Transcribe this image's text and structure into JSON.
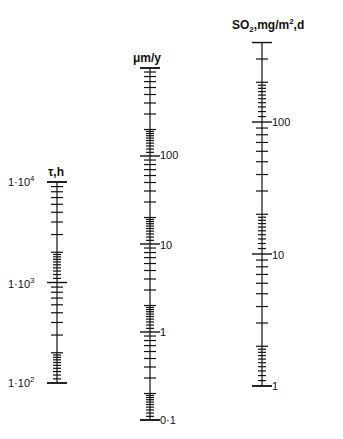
{
  "chart_data": {
    "type": "nomogram",
    "title": "",
    "axes": [
      {
        "id": "tau",
        "title": "τ, h",
        "scale": "log",
        "range": [
          100,
          10000
        ],
        "tick_labels": [
          "1·10²",
          "1·10³",
          "1·10⁴"
        ],
        "tick_values": [
          100,
          1000,
          10000
        ],
        "x_px": 57,
        "value_px": {
          "100": 383,
          "10000": 182
        }
      },
      {
        "id": "corrosion",
        "title": "μm/y",
        "scale": "log",
        "range": [
          0.1,
          1000
        ],
        "tick_labels": [
          "0·1",
          "1",
          "10",
          "100"
        ],
        "tick_values": [
          0.1,
          1,
          10,
          100
        ],
        "x_px": 150,
        "value_px": {
          "0.1": 420,
          "1000": 68
        }
      },
      {
        "id": "so2",
        "title": "SO₂, mg/m², d",
        "scale": "log",
        "range": [
          1,
          400
        ],
        "tick_labels": [
          "1",
          "10",
          "100"
        ],
        "tick_values": [
          1,
          10,
          100
        ],
        "x_px": 262,
        "value_px": {
          "1": 386,
          "100": 122
        }
      }
    ],
    "minor_ticks": "1.1–1.9 per decade (fine), 2–9 per decade (medium)",
    "grid": false,
    "legend": "none"
  },
  "labels": {
    "tau_title_sym": "τ",
    "tau_title_unit": ",h",
    "tau_1e2_base": "1·10",
    "tau_1e2_exp": "2",
    "tau_1e3_base": "1·10",
    "tau_1e3_exp": "3",
    "tau_1e4_base": "1·10",
    "tau_1e4_exp": "4",
    "mid_title": "μm/y",
    "mid_0_1": "0·1",
    "mid_1": "1",
    "mid_10": "10",
    "mid_100": "100",
    "so2_title_a": "SO",
    "so2_title_sub": "2",
    "so2_title_b": ",mg/m",
    "so2_title_sup": "2",
    "so2_title_c": ",d",
    "so2_1": "1",
    "so2_10": "10",
    "so2_100": "100"
  }
}
